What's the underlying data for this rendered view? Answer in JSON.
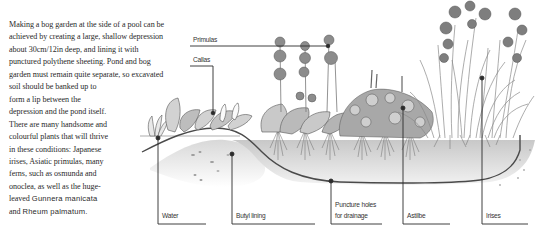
{
  "body_text": {
    "lines": [
      "Making a bog garden at the side of a pool can be",
      "achieved by creating a large, shallow depression",
      "about 30cm/12in deep, and lining it with",
      "punctured polythene sheeting. Pond and bog",
      "garden must remain quite separate, so excavated",
      "soil should be banked up to",
      "form a lip between the",
      "depression and the pond itself.",
      "There are many handsome and",
      "colourful plants that will thrive",
      "in these conditions: Japanese",
      "irises, Asiatic primulas, many",
      "ferns, such as osmunda and",
      "onoclea, as well as the huge-",
      "leaved ",
      "Gunnera manicata",
      "and ",
      "Rheum palmatum."
    ]
  },
  "diagram": {
    "labels": {
      "primulas": "Primulas",
      "callas": "Callas",
      "water": "Water",
      "butyl_lining": "Butyl lining",
      "puncture_line1": "Puncture holes",
      "puncture_line2": "for drainage",
      "astilbe": "Astilbe",
      "irises": "Irises"
    },
    "colors": {
      "line": "#2b2b2b",
      "soil": "#d6d6d6",
      "foliage": "#8a8a8a"
    }
  }
}
